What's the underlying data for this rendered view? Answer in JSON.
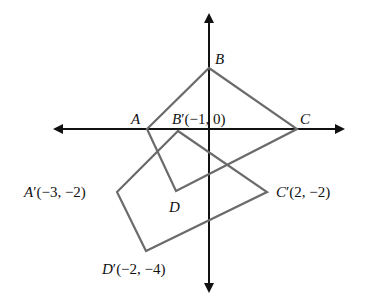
{
  "diagram": {
    "type": "coordinate-plane-transformation",
    "colors": {
      "axes": "#111111",
      "polygon": "#6b6b6b",
      "background": "#ffffff"
    },
    "axes": {
      "origin_px": [
        209,
        129
      ],
      "x_axis": {
        "left_px": 55,
        "right_px": 343
      },
      "y_axis": {
        "top_px": 15,
        "bottom_px": 291
      }
    },
    "original_quadrilateral": {
      "vertices": [
        {
          "name": "A",
          "label": "A",
          "px": [
            147,
            129
          ]
        },
        {
          "name": "B",
          "label": "B",
          "px": [
            209,
            68
          ]
        },
        {
          "name": "C",
          "label": "C",
          "px": [
            297,
            129
          ]
        },
        {
          "name": "D",
          "label": "D",
          "px": [
            176,
            191
          ]
        }
      ]
    },
    "image_quadrilateral": {
      "vertices": [
        {
          "name": "A'",
          "letter": "A",
          "prime": "′",
          "coords": "(−3, −2)",
          "px": [
            117,
            192
          ]
        },
        {
          "name": "B'",
          "letter": "B",
          "prime": "′",
          "coords": "(−1, 0)",
          "px": [
            178,
            131
          ]
        },
        {
          "name": "C'",
          "letter": "C",
          "prime": "′",
          "coords": "(2, −2)",
          "px": [
            267,
            192
          ]
        },
        {
          "name": "D'",
          "letter": "D",
          "prime": "′",
          "coords": "(−2, −4)",
          "px": [
            146,
            251
          ]
        }
      ]
    }
  }
}
